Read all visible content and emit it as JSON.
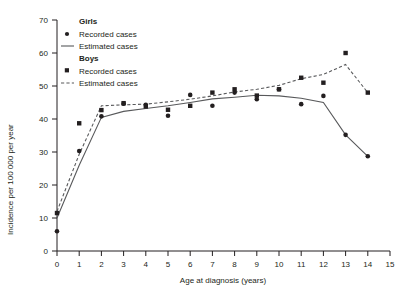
{
  "chart_data": {
    "type": "scatter",
    "title": "",
    "xlabel": "Age at diagnosis (years)",
    "ylabel": "Incidence per 100 000 per year",
    "xlim": [
      0,
      15
    ],
    "ylim": [
      0,
      70
    ],
    "xticks": [
      "0",
      "1",
      "2",
      "3",
      "4",
      "5",
      "6",
      "7",
      "8",
      "9",
      "10",
      "11",
      "12",
      "13",
      "14",
      "15"
    ],
    "yticks": [
      "0",
      "10",
      "20",
      "30",
      "40",
      "50",
      "60",
      "70"
    ],
    "grid": false,
    "legend_position": "top-left-inside",
    "legend": [
      {
        "group": "Girls",
        "entries": [
          "Recorded cases",
          "Estimated cases"
        ]
      },
      {
        "group": "Boys",
        "entries": [
          "Recorded cases",
          "Estimated cases"
        ]
      }
    ],
    "series": [
      {
        "name": "Girls recorded cases",
        "type": "scatter",
        "marker": "circle",
        "x": [
          0,
          1,
          2,
          3,
          4,
          5,
          6,
          7,
          8,
          9,
          10,
          11,
          12,
          13,
          14
        ],
        "y": [
          6.0,
          30.3,
          40.8,
          44.6,
          44.3,
          41.0,
          47.3,
          44.0,
          48.0,
          46.0,
          49.0,
          44.5,
          47.0,
          35.2,
          28.7
        ]
      },
      {
        "name": "Girls estimated cases",
        "type": "line",
        "style": "solid",
        "x": [
          0,
          1,
          2,
          3,
          4,
          5,
          6,
          7,
          8,
          9,
          10,
          11,
          12,
          13,
          14
        ],
        "y": [
          10.0,
          26.0,
          40.5,
          42.3,
          43.2,
          44.0,
          45.0,
          46.1,
          46.6,
          47.2,
          47.0,
          46.3,
          45.0,
          35.2,
          28.7
        ]
      },
      {
        "name": "Boys recorded cases",
        "type": "scatter",
        "marker": "square",
        "x": [
          0,
          1,
          2,
          3,
          4,
          5,
          6,
          7,
          8,
          9,
          10,
          11,
          12,
          13,
          14
        ],
        "y": [
          11.5,
          38.7,
          42.7,
          44.8,
          43.8,
          42.8,
          44.0,
          48.0,
          49.0,
          47.1,
          49.0,
          52.5,
          51.0,
          60.0,
          48.0
        ]
      },
      {
        "name": "Boys estimated cases",
        "type": "line",
        "style": "dashed",
        "x": [
          0,
          1,
          2,
          3,
          4,
          5,
          6,
          7,
          8,
          9,
          10,
          11,
          12,
          13,
          14
        ],
        "y": [
          12.0,
          29.3,
          44.0,
          44.3,
          44.5,
          45.2,
          46.0,
          47.0,
          48.2,
          49.0,
          50.2,
          52.2,
          53.5,
          56.5,
          48.0
        ]
      }
    ]
  },
  "axes": {
    "x_title": "Age at diagnosis (years)",
    "y_title": "Incidence per 100 000 per year"
  },
  "legend": {
    "girls_title": "Girls",
    "girls_recorded": "Recorded cases",
    "girls_estimated": "Estimated cases",
    "boys_title": "Boys",
    "boys_recorded": "Recorded cases",
    "boys_estimated": "Estimated cases"
  },
  "colors": {
    "ink": "#231f20",
    "line": "#58595b",
    "background": "#ffffff"
  }
}
